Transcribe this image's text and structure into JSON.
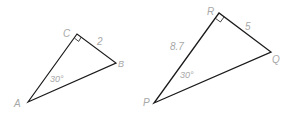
{
  "diagram": {
    "colors": {
      "line": "#1a1a1a",
      "label": "#a8a8a8",
      "background": "#ffffff"
    },
    "triangles": [
      {
        "name": "ABC",
        "vertices": {
          "A": {
            "label": "A",
            "x": 28,
            "y": 102
          },
          "B": {
            "label": "B",
            "x": 116,
            "y": 63
          },
          "C": {
            "label": "C",
            "x": 77,
            "y": 34
          }
        },
        "right_angle_at": "C",
        "angle_label": "30°",
        "angle_at": "A",
        "side_labels": {
          "CB": "2"
        }
      },
      {
        "name": "PQR",
        "vertices": {
          "P": {
            "label": "P",
            "x": 154,
            "y": 103
          },
          "Q": {
            "label": "Q",
            "x": 271,
            "y": 52
          },
          "R": {
            "label": "R",
            "x": 219,
            "y": 13
          }
        },
        "right_angle_at": "R",
        "angle_label": "30°",
        "angle_at": "P",
        "side_labels": {
          "RQ": "5",
          "PR": "8.7"
        }
      }
    ]
  }
}
